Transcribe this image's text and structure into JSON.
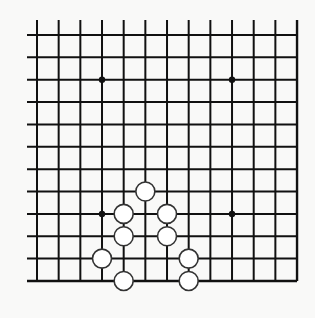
{
  "board": {
    "columns": 13,
    "rows": 12,
    "origin": {
      "x": 37,
      "y": 35
    },
    "spacing": {
      "x": 21.67,
      "y": 22.36
    },
    "open_edges": {
      "top": true,
      "left": true,
      "bottom": false,
      "right": false
    },
    "overhang": {
      "top": 15,
      "left": 10
    },
    "line_color": "#111111",
    "background_color": "#f9f9f8",
    "star_points": [
      {
        "col": 3,
        "row": 2
      },
      {
        "col": 9,
        "row": 2
      },
      {
        "col": 3,
        "row": 8
      },
      {
        "col": 9,
        "row": 8
      }
    ],
    "stones": [
      {
        "col": 5,
        "row": 7,
        "color": "white"
      },
      {
        "col": 4,
        "row": 8,
        "color": "white"
      },
      {
        "col": 6,
        "row": 8,
        "color": "white"
      },
      {
        "col": 4,
        "row": 9,
        "color": "white"
      },
      {
        "col": 6,
        "row": 9,
        "color": "white"
      },
      {
        "col": 3,
        "row": 10,
        "color": "white"
      },
      {
        "col": 7,
        "row": 10,
        "color": "white"
      },
      {
        "col": 4,
        "row": 11,
        "color": "white"
      },
      {
        "col": 7,
        "row": 11,
        "color": "white"
      }
    ],
    "stone_colors": {
      "white_fill": "#ffffff",
      "white_stroke": "#333333"
    }
  }
}
